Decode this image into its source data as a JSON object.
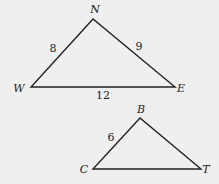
{
  "diagram": {
    "background": "#efefef",
    "stroke_color": "#222222",
    "triangles": [
      {
        "name": "NWE",
        "vertices": [
          {
            "label": "N",
            "x": 93,
            "y": 19,
            "lx": 95,
            "ly": 13
          },
          {
            "label": "W",
            "x": 31,
            "y": 87,
            "lx": 19,
            "ly": 92
          },
          {
            "label": "E",
            "x": 175,
            "y": 87,
            "lx": 181,
            "ly": 92
          }
        ],
        "sides": [
          {
            "between": "NW",
            "length": "8",
            "lx": 53,
            "ly": 52
          },
          {
            "between": "NE",
            "length": "9",
            "lx": 139,
            "ly": 50
          },
          {
            "between": "WE",
            "length": "12",
            "lx": 103,
            "ly": 99
          }
        ]
      },
      {
        "name": "BCT",
        "vertices": [
          {
            "label": "B",
            "x": 140,
            "y": 118,
            "lx": 141,
            "ly": 113
          },
          {
            "label": "C",
            "x": 93,
            "y": 169,
            "lx": 84,
            "ly": 173
          },
          {
            "label": "T",
            "x": 201,
            "y": 169,
            "lx": 206,
            "ly": 173
          }
        ],
        "sides": [
          {
            "between": "BC",
            "length": "6",
            "lx": 111,
            "ly": 141
          }
        ]
      }
    ]
  }
}
